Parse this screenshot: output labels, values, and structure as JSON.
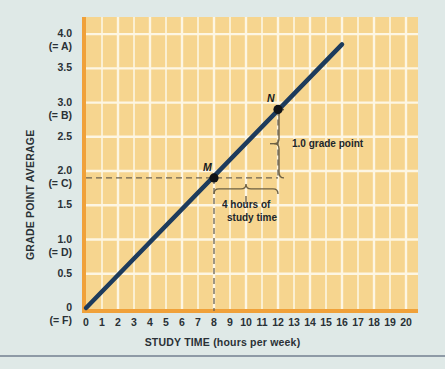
{
  "chart_data": {
    "type": "line",
    "title": "",
    "xlabel": "STUDY TIME (hours per week)",
    "ylabel": "GRADE  POINT  AVERAGE",
    "xlim": [
      0,
      20
    ],
    "ylim": [
      0,
      4.25
    ],
    "xticks": [
      "0",
      "1",
      "2",
      "3",
      "4",
      "5",
      "6",
      "7",
      "8",
      "9",
      "10",
      "11",
      "12",
      "13",
      "14",
      "15",
      "16",
      "17",
      "18",
      "19",
      "20"
    ],
    "xtick_values": [
      0,
      1,
      2,
      3,
      4,
      5,
      6,
      7,
      8,
      9,
      10,
      11,
      12,
      13,
      14,
      15,
      16,
      17,
      18,
      19,
      20
    ],
    "yticks": [
      {
        "value": 4.0,
        "label": "4.0",
        "sublabel": "(= A)"
      },
      {
        "value": 3.5,
        "label": "3.5",
        "sublabel": ""
      },
      {
        "value": 3.0,
        "label": "3.0",
        "sublabel": "(= B)"
      },
      {
        "value": 2.5,
        "label": "2.5",
        "sublabel": ""
      },
      {
        "value": 2.0,
        "label": "2.0",
        "sublabel": "(= C)"
      },
      {
        "value": 1.5,
        "label": "1.5",
        "sublabel": ""
      },
      {
        "value": 1.0,
        "label": "1.0",
        "sublabel": "(= D)"
      },
      {
        "value": 0.5,
        "label": "0.5",
        "sublabel": ""
      },
      {
        "value": 0.0,
        "label": "0",
        "sublabel": "(= F)"
      }
    ],
    "grid": true,
    "legend": "none",
    "series": [
      {
        "name": "grade point average vs study time",
        "type": "line",
        "x": [
          0,
          16
        ],
        "y": [
          0.0,
          3.85
        ],
        "color": "#1d3b5c",
        "linewidth": 4.5
      }
    ],
    "points": [
      {
        "label": "M",
        "x": 8,
        "y": 1.9
      },
      {
        "label": "N",
        "x": 12,
        "y": 2.9
      }
    ],
    "annotations": [
      {
        "name": "rise-annotation",
        "text": "1.0 grade point",
        "from": {
          "x": 12,
          "y": 1.9
        },
        "to": {
          "x": 12,
          "y": 2.9
        }
      },
      {
        "name": "run-annotation",
        "line1": "4 hours of",
        "line2": "study time",
        "from": {
          "x": 8,
          "y": 1.9
        },
        "to": {
          "x": 12,
          "y": 1.9
        }
      }
    ],
    "colors": {
      "plot_background": "#f6d58f",
      "grid_line": "#fdf6e3",
      "axis_spine": "#f0a13a",
      "line": "#1d3b5c",
      "marker": "#101317",
      "dash": "#6b6250",
      "brace": "#6d6043",
      "page_background": "#dfe9e7",
      "text": "#2a3136",
      "rule": "#8e9aa6"
    }
  }
}
